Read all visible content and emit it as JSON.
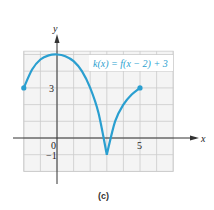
{
  "chart_data": {
    "type": "line",
    "title": "",
    "caption": "(c)",
    "xlabel": "x",
    "ylabel": "y",
    "xlim": [
      -2,
      7
    ],
    "ylim": [
      -2,
      5.2
    ],
    "grid": true,
    "x_tick_labels": [
      {
        "value": 0,
        "label": "0"
      },
      {
        "value": 5,
        "label": "5"
      }
    ],
    "y_tick_labels": [
      {
        "value": 3,
        "label": "3"
      },
      {
        "value": -1,
        "label": "-1"
      }
    ],
    "annotation": "k(x) = f(x − 2) + 3",
    "series": [
      {
        "name": "k(x) = f(x − 2) + 3",
        "color": "#2a9fd0",
        "points": [
          [
            -2,
            3
          ],
          [
            -1.5,
            4.1
          ],
          [
            -1,
            4.7
          ],
          [
            -0.5,
            4.95
          ],
          [
            0,
            5
          ],
          [
            0.5,
            4.9
          ],
          [
            1,
            4.6
          ],
          [
            1.5,
            4.0
          ],
          [
            2,
            3.0
          ],
          [
            2.5,
            1.5
          ],
          [
            3,
            -1
          ],
          [
            3.5,
            1.0
          ],
          [
            4,
            2.0
          ],
          [
            4.5,
            2.6
          ],
          [
            5,
            3
          ]
        ],
        "endpoints": [
          [
            -2,
            3
          ],
          [
            5,
            3
          ]
        ]
      }
    ]
  }
}
